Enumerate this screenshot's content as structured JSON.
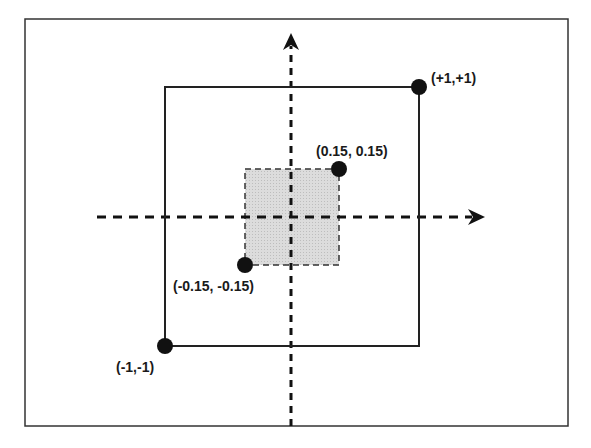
{
  "diagram": {
    "frame": {
      "x": 25,
      "y": 19,
      "w": 543,
      "h": 407
    },
    "axes": {
      "vertical": {
        "x": 291,
        "y1": 426,
        "y2": 35
      },
      "horizontal": {
        "y": 217,
        "x1": 97,
        "x2": 484
      }
    },
    "outer_square": {
      "x1": 165,
      "y1": 87,
      "x2": 419,
      "y2": 346,
      "range": "[-1, +1]"
    },
    "inner_square": {
      "x1": 245,
      "y1": 169,
      "x2": 339,
      "y2": 265,
      "fill": "#d9d9d9",
      "range": "[-0.15, 0.15]"
    },
    "points": [
      {
        "label": "(+1,+1)",
        "cx": 419,
        "cy": 87
      },
      {
        "label": "(0.15, 0.15)",
        "cx": 339,
        "cy": 169
      },
      {
        "label": "(-0.15, -0.15)",
        "cx": 245,
        "cy": 265
      },
      {
        "label": "(-1,-1)",
        "cx": 165,
        "cy": 346
      }
    ]
  }
}
